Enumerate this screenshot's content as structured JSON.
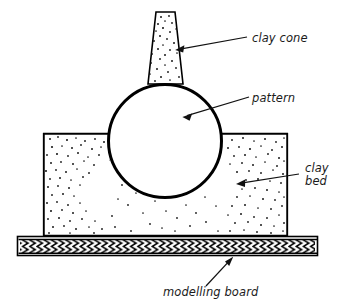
{
  "figure": {
    "background_color": "#ffffff",
    "line_color": "#000000",
    "text_color": "#1b1b1b",
    "width": 339,
    "height": 308
  },
  "labels": {
    "clay_cone": "clay cone",
    "pattern": "pattern",
    "clay_bed_line1": "clay",
    "clay_bed_line2": "bed",
    "modelling_board": "modelling board"
  },
  "parts": {
    "clay_cone": {
      "name": "clay cone",
      "shape": "tapered trapezoid",
      "fill": "stippled",
      "top_left_x": 156,
      "top_right_x": 175,
      "top_y": 12,
      "bottom_left_x": 148,
      "bottom_right_x": 183,
      "bottom_y": 84
    },
    "pattern": {
      "name": "pattern",
      "shape": "circle",
      "fill": "white",
      "center_x": 165,
      "center_y": 141,
      "radius": 57,
      "stroke_width": 3
    },
    "clay_bed": {
      "name": "clay bed",
      "shape": "rectangle with circular cavity",
      "fill": "stippled",
      "left_x": 43,
      "right_x": 288,
      "top_y": 133,
      "bottom_y": 236
    },
    "modelling_board": {
      "name": "modelling board",
      "shape": "hatched horizontal board",
      "fill": "chevron hatch",
      "left_x": 17,
      "right_x": 318,
      "top_y": 236,
      "bottom_y": 256
    }
  },
  "leaders": [
    {
      "target": "clay cone",
      "from_x": 247,
      "from_y": 37,
      "to_x": 176,
      "to_y": 50
    },
    {
      "target": "pattern",
      "from_x": 249,
      "from_y": 97,
      "to_x": 183,
      "to_y": 117
    },
    {
      "target": "clay bed",
      "from_x": 299,
      "from_y": 174,
      "to_x": 236,
      "to_y": 184
    },
    {
      "target": "modelling board",
      "from_x": 206,
      "from_y": 286,
      "to_x": 233,
      "to_y": 257
    }
  ]
}
